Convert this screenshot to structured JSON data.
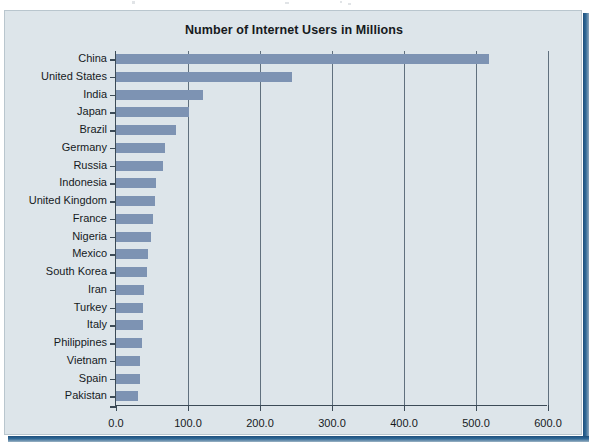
{
  "figure": {
    "title": "Number of Internet Users in Millions",
    "bar_color": "#7d93b3",
    "background_color": "#dde5ea",
    "axis_color": "#3c4b57"
  },
  "chart_data": {
    "type": "bar",
    "orientation": "horizontal",
    "title": "Number of Internet Users in Millions",
    "xlabel": "",
    "ylabel": "",
    "xlim": [
      0,
      600
    ],
    "xticks": [
      "0.0",
      "100.0",
      "200.0",
      "300.0",
      "400.0",
      "500.0",
      "600.0"
    ],
    "xtick_values": [
      0,
      100,
      200,
      300,
      400,
      500,
      600
    ],
    "grid": true,
    "legend": null,
    "categories": [
      "China",
      "United States",
      "India",
      "Japan",
      "Brazil",
      "Germany",
      "Russia",
      "Indonesia",
      "United Kingdom",
      "France",
      "Nigeria",
      "Mexico",
      "South Korea",
      "Iran",
      "Turkey",
      "Italy",
      "Philippines",
      "Vietnam",
      "Spain",
      "Pakistan"
    ],
    "values": [
      518,
      244,
      121,
      101,
      83,
      68,
      65,
      55,
      54,
      52,
      48,
      44,
      43,
      39,
      38,
      37,
      36,
      34,
      33,
      31
    ],
    "series": [
      {
        "name": "Internet Users (millions)",
        "values": [
          518,
          244,
          121,
          101,
          83,
          68,
          65,
          55,
          54,
          52,
          48,
          44,
          43,
          39,
          38,
          37,
          36,
          34,
          33,
          31
        ]
      }
    ]
  }
}
